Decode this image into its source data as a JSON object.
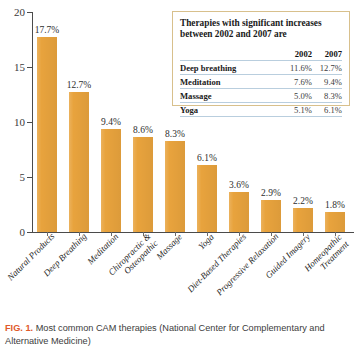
{
  "chart_data": {
    "type": "bar",
    "title": "",
    "xlabel": "",
    "ylabel": "",
    "ylim": [
      0,
      20
    ],
    "yticks": [
      0,
      5,
      10,
      15,
      20
    ],
    "grid": false,
    "legend": "none",
    "bar_color": "#E8A33D",
    "categories": [
      "Natural Products",
      "Deep Breathing",
      "Chiropractic & Osteopathic",
      "Massage",
      "Yoga",
      "Meditation",
      "Diet-Based Therapies",
      "Progressive Relaxation",
      "Guided Imagery",
      "Homeopathic Treatment"
    ],
    "bars": [
      {
        "label_line1": "Natural Products",
        "label_line2": "",
        "value": 17.7,
        "value_label": "17.7%"
      },
      {
        "label_line1": "Deep Breathing",
        "label_line2": "",
        "value": 12.7,
        "value_label": "12.7%"
      },
      {
        "label_line1": "Meditation",
        "label_line2": "",
        "value": 9.4,
        "value_label": "9.4%"
      },
      {
        "label_line1": "Chiropractic &",
        "label_line2": "Osteopathic",
        "value": 8.6,
        "value_label": "8.6%"
      },
      {
        "label_line1": "Massage",
        "label_line2": "",
        "value": 8.3,
        "value_label": "8.3%"
      },
      {
        "label_line1": "Yoga",
        "label_line2": "",
        "value": 6.1,
        "value_label": "6.1%"
      },
      {
        "label_line1": "Diet-Based Therapies",
        "label_line2": "",
        "value": 3.6,
        "value_label": "3.6%"
      },
      {
        "label_line1": "Progressive Relaxation",
        "label_line2": "",
        "value": 2.9,
        "value_label": "2.9%"
      },
      {
        "label_line1": "Guided Imagery",
        "label_line2": "",
        "value": 2.2,
        "value_label": "2.2%"
      },
      {
        "label_line1": "Homeopathic",
        "label_line2": "Treatment",
        "value": 1.8,
        "value_label": "1.8%"
      }
    ],
    "values": [
      17.7,
      12.7,
      9.4,
      8.6,
      8.3,
      6.1,
      3.6,
      2.9,
      2.2,
      1.8
    ],
    "ytick_labels": [
      "0",
      "5",
      "10",
      "15",
      "20"
    ]
  },
  "inset": {
    "title": "Therapies with significant increases between 2002 and 2007 are",
    "corner_header": "",
    "columns": [
      "2002",
      "2007"
    ],
    "rows": [
      {
        "therapy": "Deep breathing",
        "y2002": "11.6%",
        "y2007": "12.7%"
      },
      {
        "therapy": "Meditation",
        "y2002": "7.6%",
        "y2007": "9.4%"
      },
      {
        "therapy": "Massage",
        "y2002": "5.0%",
        "y2007": "8.3%"
      },
      {
        "therapy": "Yoga",
        "y2002": "5.1%",
        "y2007": "6.1%"
      }
    ]
  },
  "caption": {
    "fig_label": "FIG. 1.",
    "text": "Most common CAM therapies (National Center for Complementary and Alternative Medicine)"
  }
}
